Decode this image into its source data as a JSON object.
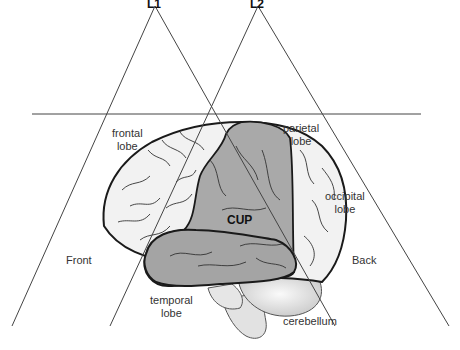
{
  "diagram": {
    "type": "brain lobes with two triangular views",
    "views": [
      {
        "id": "L1",
        "label": "L1"
      },
      {
        "id": "L2",
        "label": "L2"
      }
    ],
    "lobe_labels": {
      "frontal": [
        "frontal",
        "lobe"
      ],
      "parietal": [
        "parietal",
        "lobe"
      ],
      "occipital": [
        "occipital",
        "lobe"
      ],
      "temporal": [
        "temporal",
        "lobe"
      ],
      "cerebellum": "cerebellum"
    },
    "highlight_label": "CUP",
    "direction_labels": {
      "front": "Front",
      "back": "Back"
    },
    "colors": {
      "line": "#444444",
      "outline": "#1a1a1a",
      "cortex_light": "#f0f0f0",
      "cup_region": "#a9a9a9",
      "cerebellum": "#dcdcdc"
    }
  }
}
